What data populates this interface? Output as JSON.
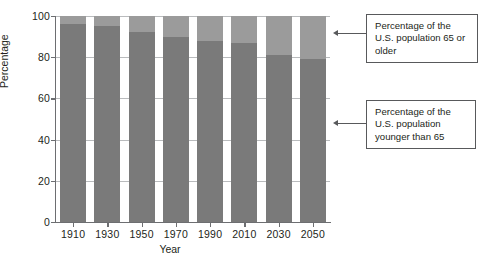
{
  "chart_data": {
    "type": "bar",
    "title": "",
    "xlabel": "Year",
    "ylabel": "Percentage",
    "ylim": [
      0,
      100
    ],
    "ytick_labels": [
      "0",
      "20",
      "40",
      "60",
      "80",
      "100"
    ],
    "ytick_values": [
      0,
      20,
      40,
      60,
      80,
      100
    ],
    "grid": true,
    "stacked": true,
    "legend_position": "annotations-right",
    "categories": [
      "1910",
      "1930",
      "1950",
      "1970",
      "1990",
      "2010",
      "2030",
      "2050"
    ],
    "series": [
      {
        "name": "Percentage of the U.S. population younger than 65",
        "color": "#7a7a7a",
        "values": [
          96,
          95,
          92,
          90,
          88,
          87,
          81,
          79
        ]
      },
      {
        "name": "Percentage of the U.S. population 65 or older",
        "color": "#9b9b9b",
        "values": [
          4,
          5,
          8,
          10,
          12,
          13,
          19,
          21
        ]
      }
    ],
    "annotations": [
      {
        "id": "older",
        "text": "Percentage of the U.S. population 65 or older"
      },
      {
        "id": "younger",
        "text": "Percentage of the U.S. population younger than 65"
      }
    ]
  },
  "colors": {
    "segment_older": "#9b9b9b",
    "segment_younger": "#7a7a7a",
    "axis": "#6d6e71",
    "gridline": "#b9bbbd",
    "callout_border": "#58595b",
    "text": "#231f20",
    "background": "#ffffff"
  }
}
